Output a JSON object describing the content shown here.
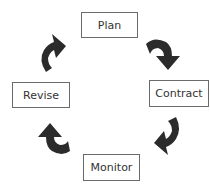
{
  "diagram": {
    "type": "cycle",
    "nodes": [
      {
        "id": "plan",
        "label": "Plan"
      },
      {
        "id": "contract",
        "label": "Contract"
      },
      {
        "id": "monitor",
        "label": "Monitor"
      },
      {
        "id": "revise",
        "label": "Revise"
      }
    ],
    "edges": [
      {
        "from": "plan",
        "to": "contract"
      },
      {
        "from": "contract",
        "to": "monitor"
      },
      {
        "from": "monitor",
        "to": "revise"
      },
      {
        "from": "revise",
        "to": "plan"
      }
    ],
    "colors": {
      "arrow": "#2b2b2b",
      "box_border": "#6a6a6a",
      "text": "#333333"
    }
  }
}
